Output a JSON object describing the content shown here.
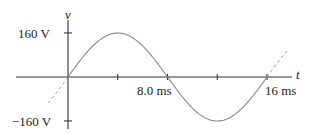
{
  "chart_data": {
    "type": "line",
    "title": "",
    "xlabel": "t",
    "ylabel": "v",
    "x_unit": "ms",
    "y_unit": "V",
    "function": "v(t) = 160 sin(2*pi*t/16)",
    "amplitude": 160,
    "period_ms": 16,
    "x_ticks": [
      0,
      4,
      8,
      12,
      16
    ],
    "x_tick_labels": [
      "",
      "",
      "8.0 ms",
      "",
      "16 ms"
    ],
    "y_ticks": [
      160,
      -160
    ],
    "y_tick_labels": [
      "160 V",
      "−160 V"
    ],
    "x": [
      0,
      2,
      4,
      6,
      8,
      10,
      12,
      14,
      16
    ],
    "values": [
      0,
      113,
      160,
      113,
      0,
      -113,
      -160,
      -113,
      0
    ],
    "xlim": [
      -3.5,
      18
    ],
    "ylim": [
      -180,
      200
    ],
    "grid": false,
    "dashed_extensions": true
  },
  "labels": {
    "y_axis": "v",
    "x_axis": "t",
    "y_max": "160 V",
    "y_min": "−160 V",
    "x_mid": "8.0 ms",
    "x_end": "16 ms"
  },
  "colors": {
    "axis": "#333333",
    "curve": "#888888",
    "text": "#222222"
  }
}
